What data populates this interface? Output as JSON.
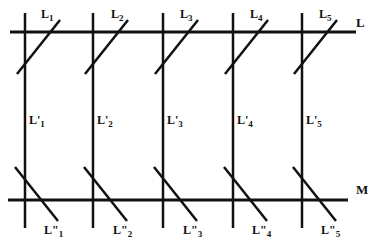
{
  "diagram": {
    "line_color": "#111111",
    "background": "#ffffff",
    "horizontal_lines": [
      {
        "label": "L",
        "y": 32,
        "x1": 10,
        "x2": 356,
        "label_x": 356,
        "label_y": 26
      },
      {
        "label": "M",
        "y": 200,
        "x1": 8,
        "x2": 348,
        "label_x": 356,
        "label_y": 193
      }
    ],
    "columns": [
      {
        "x": 25,
        "top_label": "L",
        "top_sub": "1",
        "mid_label": "L'",
        "mid_sub": "1",
        "bottom_label": "L\"",
        "bottom_sub": "1"
      },
      {
        "x": 93,
        "top_label": "L",
        "top_sub": "2",
        "mid_label": "L'",
        "mid_sub": "2",
        "bottom_label": "L\"",
        "bottom_sub": "2"
      },
      {
        "x": 163,
        "top_label": "L",
        "top_sub": "3",
        "mid_label": "L'",
        "mid_sub": "3",
        "bottom_label": "L\"",
        "bottom_sub": "3"
      },
      {
        "x": 233,
        "top_label": "L",
        "top_sub": "4",
        "mid_label": "L'",
        "mid_sub": "4",
        "bottom_label": "L\"",
        "bottom_sub": "4"
      },
      {
        "x": 302,
        "top_label": "L",
        "top_sub": "5",
        "mid_label": "L'",
        "mid_sub": "5",
        "bottom_label": "L\"",
        "bottom_sub": "5"
      }
    ]
  }
}
